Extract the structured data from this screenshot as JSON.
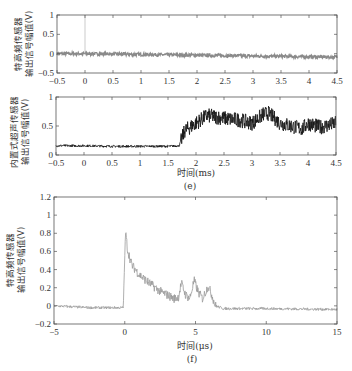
{
  "chart_data": [
    {
      "id": "panel-top",
      "type": "line",
      "title": "",
      "xlabel": "",
      "ylabel": "特高频传感器\n输出信号幅值(V)",
      "ylabel_lines": [
        "特高频传感器",
        "输出信号幅值(V)"
      ],
      "xlim": [
        -0.5,
        4.5
      ],
      "ylim": [
        -0.5,
        1
      ],
      "xticks": [
        -0.5,
        0,
        0.5,
        1,
        1.5,
        2,
        2.5,
        3,
        3.5,
        4,
        4.5
      ],
      "xtick_labels": [
        "-0.5",
        "0",
        "0.5",
        "1",
        "1.5",
        "2",
        "2.5",
        "3",
        "3.5",
        "4",
        "4.5"
      ],
      "yticks": [
        -0.5,
        0,
        0.5,
        1
      ],
      "ytick_labels": [
        "-0.5",
        "0",
        "0.5",
        "1"
      ],
      "series": [
        {
          "name": "UHF sensor",
          "color": "#8a8a8a",
          "x": [
            -0.5,
            0,
            0.5,
            1,
            1.5,
            2,
            2.5,
            3,
            3.5,
            4,
            4.5
          ],
          "values": [
            0.0,
            0.0,
            -0.01,
            -0.02,
            -0.03,
            -0.04,
            -0.05,
            -0.06,
            -0.07,
            -0.08,
            -0.09
          ],
          "band_halfwidth": 0.04,
          "spike": {
            "x": 0,
            "value": 1
          }
        }
      ],
      "grid": false
    },
    {
      "id": "panel-middle",
      "type": "line",
      "title": "",
      "xlabel": "时间(ms)",
      "caption": "(e)",
      "ylabel": "内置式超声传感器\n输出信号幅值(V)",
      "ylabel_lines": [
        "内置式超声传感器",
        "输出信号幅值(V)"
      ],
      "xlim": [
        -0.5,
        4.5
      ],
      "ylim": [
        0,
        1
      ],
      "xticks": [
        -0.5,
        0,
        0.5,
        1,
        1.5,
        2,
        2.5,
        3,
        3.5,
        4,
        4.5
      ],
      "xtick_labels": [
        "-0.5",
        "0",
        "0.5",
        "1",
        "1.5",
        "2",
        "2.5",
        "3",
        "3.5",
        "4",
        "4.5"
      ],
      "yticks": [
        0,
        0.5,
        1
      ],
      "ytick_labels": [
        "0",
        "0.5",
        "1"
      ],
      "series": [
        {
          "name": "Ultrasonic sensor",
          "color": "#111111",
          "x": [
            -0.5,
            0,
            0.5,
            1,
            1.5,
            1.7,
            1.8,
            2.0,
            2.2,
            2.4,
            2.6,
            2.8,
            3.0,
            3.2,
            3.3,
            3.5,
            3.7,
            3.9,
            4.0,
            4.2,
            4.4,
            4.5
          ],
          "values": [
            0.16,
            0.16,
            0.15,
            0.15,
            0.15,
            0.16,
            0.42,
            0.55,
            0.68,
            0.65,
            0.62,
            0.6,
            0.55,
            0.7,
            0.72,
            0.55,
            0.5,
            0.45,
            0.55,
            0.48,
            0.52,
            0.55
          ]
        }
      ],
      "grid": false
    },
    {
      "id": "panel-bottom",
      "type": "line",
      "title": "",
      "xlabel": "时间(μs)",
      "caption": "(f)",
      "ylabel": "特高频传感器\n输出信号幅值(V)",
      "ylabel_lines": [
        "特高频传感器",
        "输出信号幅值(V)"
      ],
      "xlim": [
        -5,
        15
      ],
      "ylim": [
        -0.2,
        1.2
      ],
      "xticks": [
        -5,
        0,
        5,
        10,
        15
      ],
      "xtick_labels": [
        "-5",
        "0",
        "5",
        "10",
        "15"
      ],
      "yticks": [
        -0.2,
        0,
        0.2,
        0.4,
        0.6,
        0.8,
        1,
        1.2
      ],
      "ytick_labels": [
        "-0.2",
        "0",
        "0.2",
        "0.4",
        "0.6",
        "0.8",
        "1",
        "1.2"
      ],
      "series": [
        {
          "name": "UHF sensor",
          "color": "#9a9a9a",
          "x": [
            -5,
            -2.5,
            -0.1,
            0.05,
            0.2,
            0.5,
            1,
            1.5,
            2,
            2.5,
            3,
            3.5,
            3.8,
            4.0,
            4.3,
            4.6,
            4.9,
            5.2,
            5.5,
            5.9,
            6.2,
            6.4,
            7,
            10,
            15
          ],
          "values": [
            0.0,
            -0.02,
            -0.02,
            0.82,
            0.62,
            0.45,
            0.35,
            0.28,
            0.22,
            0.16,
            0.12,
            0.08,
            0.1,
            0.25,
            0.12,
            0.08,
            0.28,
            0.15,
            0.08,
            0.22,
            0.1,
            0.0,
            -0.03,
            -0.03,
            -0.04
          ]
        }
      ],
      "grid": false
    }
  ],
  "labels": {
    "top_ylabel_1": "特高频传感器",
    "top_ylabel_2": "输出信号幅值(V)",
    "mid_ylabel_1": "内置式超声传感器",
    "mid_ylabel_2": "输出信号幅值(V)",
    "mid_xlabel": "时间(ms)",
    "mid_caption": "(e)",
    "bot_ylabel_1": "特高频传感器",
    "bot_ylabel_2": "输出信号幅值(V)",
    "bot_xlabel": "时间(μs)",
    "bot_caption": "(f)"
  }
}
